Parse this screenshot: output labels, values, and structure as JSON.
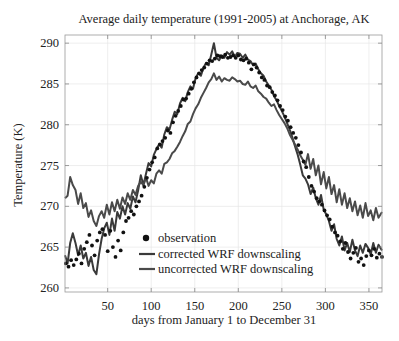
{
  "chart_data": {
    "type": "line",
    "title": "Average daily temperature (1991-2005) at Anchorage, AK",
    "xlabel": "days from January 1 to December 31",
    "ylabel": "Temperature (K)",
    "xlim": [
      1,
      365
    ],
    "ylim": [
      259.5,
      291
    ],
    "xticks": [
      50,
      100,
      150,
      200,
      250,
      300,
      350
    ],
    "yticks": [
      260,
      265,
      270,
      275,
      280,
      285,
      290
    ],
    "grid": true,
    "legend_position": "lower-left-center",
    "legend": [
      {
        "name": "observation",
        "marker": "dot",
        "color": "#111111"
      },
      {
        "name": "corrected WRF downscaling",
        "marker": "line",
        "color": "#3a3a3a"
      },
      {
        "name": "uncorrected WRF downscaling",
        "marker": "line",
        "color": "#4a4a4a"
      }
    ],
    "series": [
      {
        "name": "observation",
        "style": "scatter",
        "color": "#111111",
        "x": [
          2,
          5,
          8,
          11,
          14,
          17,
          20,
          23,
          26,
          29,
          32,
          35,
          38,
          41,
          44,
          47,
          50,
          53,
          56,
          59,
          62,
          65,
          68,
          71,
          74,
          77,
          80,
          83,
          86,
          89,
          92,
          95,
          98,
          101,
          104,
          107,
          110,
          113,
          116,
          119,
          122,
          125,
          128,
          131,
          134,
          137,
          140,
          143,
          146,
          149,
          152,
          155,
          158,
          161,
          164,
          167,
          170,
          173,
          176,
          179,
          182,
          185,
          188,
          191,
          194,
          197,
          200,
          203,
          206,
          209,
          212,
          215,
          218,
          221,
          224,
          227,
          230,
          233,
          236,
          239,
          242,
          245,
          248,
          251,
          254,
          257,
          260,
          263,
          266,
          269,
          272,
          275,
          278,
          281,
          284,
          287,
          290,
          293,
          296,
          299,
          302,
          305,
          308,
          311,
          314,
          317,
          320,
          323,
          326,
          329,
          332,
          335,
          338,
          341,
          344,
          347,
          350,
          353,
          356,
          359,
          362,
          365
        ],
        "y": [
          263.0,
          262.6,
          263.4,
          262.8,
          263.5,
          264.2,
          263.0,
          264.8,
          265.6,
          266.5,
          265.2,
          264.0,
          265.8,
          266.8,
          267.2,
          266.5,
          264.5,
          267.0,
          265.0,
          263.8,
          265.8,
          264.6,
          266.8,
          268.2,
          268.6,
          269.4,
          269.0,
          270.0,
          270.6,
          271.3,
          272.4,
          273.5,
          274.5,
          275.4,
          276.0,
          277.1,
          277.6,
          278.0,
          278.4,
          279.3,
          279.0,
          280.3,
          281.1,
          281.7,
          282.3,
          283.1,
          283.2,
          283.8,
          284.4,
          285.2,
          285.8,
          286.3,
          286.7,
          287.0,
          287.5,
          287.9,
          287.8,
          288.1,
          288.5,
          288.4,
          288.3,
          288.6,
          288.2,
          288.3,
          288.5,
          288.2,
          288.5,
          288.0,
          287.9,
          288.1,
          287.6,
          286.8,
          287.4,
          287.0,
          286.4,
          285.8,
          285.5,
          284.8,
          284.6,
          284.0,
          283.6,
          283.0,
          282.3,
          281.8,
          281.0,
          280.5,
          279.7,
          279.0,
          278.4,
          277.5,
          276.6,
          275.5,
          274.8,
          273.6,
          272.5,
          271.8,
          271.0,
          270.6,
          270.2,
          269.5,
          268.9,
          268.4,
          267.5,
          266.8,
          266.4,
          265.7,
          264.8,
          265.5,
          264.4,
          263.6,
          264.3,
          264.9,
          263.2,
          263.6,
          262.8,
          263.9,
          264.6,
          264.0,
          264.8,
          263.7,
          264.2,
          263.8
        ]
      },
      {
        "name": "corrected WRF downscaling",
        "style": "line",
        "color": "#3a3a3a",
        "x": [
          1,
          4,
          7,
          10,
          13,
          16,
          19,
          22,
          25,
          28,
          31,
          34,
          37,
          40,
          43,
          46,
          49,
          52,
          55,
          58,
          61,
          64,
          67,
          70,
          73,
          76,
          79,
          82,
          85,
          88,
          91,
          94,
          97,
          100,
          103,
          106,
          109,
          112,
          115,
          118,
          121,
          124,
          127,
          130,
          133,
          136,
          139,
          142,
          145,
          148,
          151,
          154,
          157,
          160,
          163,
          166,
          169,
          172,
          175,
          178,
          181,
          184,
          187,
          190,
          193,
          196,
          199,
          202,
          205,
          208,
          211,
          214,
          217,
          220,
          223,
          226,
          229,
          232,
          235,
          238,
          241,
          244,
          247,
          250,
          253,
          256,
          259,
          262,
          265,
          268,
          271,
          274,
          277,
          280,
          283,
          286,
          289,
          292,
          295,
          298,
          301,
          304,
          307,
          310,
          313,
          316,
          319,
          322,
          325,
          328,
          331,
          334,
          337,
          340,
          343,
          346,
          349,
          352,
          355,
          358,
          361,
          365
        ],
        "y": [
          264.0,
          263.0,
          265.5,
          266.7,
          265.5,
          264.0,
          265.2,
          263.6,
          264.3,
          262.7,
          263.8,
          262.2,
          261.7,
          264.1,
          266.0,
          267.3,
          268.0,
          266.5,
          268.5,
          267.0,
          269.3,
          268.5,
          270.0,
          269.0,
          270.4,
          269.7,
          271.2,
          270.5,
          272.0,
          273.8,
          272.6,
          274.0,
          275.3,
          274.9,
          276.3,
          277.0,
          277.6,
          277.2,
          278.8,
          279.7,
          279.4,
          280.6,
          281.6,
          281.3,
          282.6,
          283.3,
          282.9,
          284.0,
          284.7,
          284.4,
          285.7,
          286.3,
          286.0,
          287.0,
          287.6,
          287.3,
          288.6,
          290.0,
          288.2,
          287.9,
          288.5,
          288.2,
          288.9,
          288.6,
          289.0,
          288.3,
          288.8,
          288.7,
          288.2,
          288.6,
          288.0,
          287.8,
          287.3,
          287.5,
          286.8,
          286.3,
          286.0,
          285.3,
          284.8,
          284.3,
          283.5,
          283.0,
          282.3,
          281.7,
          281.0,
          280.2,
          279.4,
          278.5,
          277.4,
          276.4,
          275.2,
          273.8,
          273.4,
          272.7,
          271.5,
          272.3,
          271.0,
          270.2,
          271.4,
          269.6,
          269.0,
          268.2,
          267.0,
          267.8,
          266.0,
          265.2,
          266.3,
          264.6,
          265.5,
          264.4,
          265.9,
          264.6,
          263.9,
          265.2,
          264.3,
          265.4,
          264.9,
          264.1,
          265.5,
          264.3,
          265.3,
          264.6
        ]
      },
      {
        "name": "uncorrected WRF downscaling",
        "style": "line",
        "color": "#4a4a4a",
        "x": [
          1,
          4,
          7,
          10,
          13,
          16,
          19,
          22,
          25,
          28,
          31,
          34,
          37,
          40,
          43,
          46,
          49,
          52,
          55,
          58,
          61,
          64,
          67,
          70,
          73,
          76,
          79,
          82,
          85,
          88,
          91,
          94,
          97,
          100,
          103,
          106,
          109,
          112,
          115,
          118,
          121,
          124,
          127,
          130,
          133,
          136,
          139,
          142,
          145,
          148,
          151,
          154,
          157,
          160,
          163,
          166,
          169,
          172,
          175,
          178,
          181,
          184,
          187,
          190,
          193,
          196,
          199,
          202,
          205,
          208,
          211,
          214,
          217,
          220,
          223,
          226,
          229,
          232,
          235,
          238,
          241,
          244,
          247,
          250,
          253,
          256,
          259,
          262,
          265,
          268,
          271,
          274,
          277,
          280,
          283,
          286,
          289,
          292,
          295,
          298,
          301,
          304,
          307,
          310,
          313,
          316,
          319,
          322,
          325,
          328,
          331,
          334,
          337,
          340,
          343,
          346,
          349,
          352,
          355,
          358,
          361,
          365
        ],
        "y": [
          271.0,
          271.3,
          273.6,
          272.6,
          272.0,
          270.3,
          271.6,
          269.8,
          270.4,
          268.7,
          269.5,
          268.2,
          267.6,
          268.8,
          269.4,
          268.6,
          270.2,
          269.0,
          270.5,
          269.4,
          270.8,
          269.7,
          271.1,
          270.3,
          271.6,
          270.8,
          272.0,
          271.4,
          272.5,
          273.0,
          272.6,
          273.5,
          272.5,
          273.2,
          272.8,
          274.0,
          274.4,
          274.0,
          275.2,
          275.4,
          275.8,
          276.5,
          276.8,
          277.3,
          277.9,
          278.6,
          279.2,
          280.1,
          280.4,
          281.3,
          282.0,
          282.5,
          283.3,
          283.9,
          284.5,
          285.2,
          285.6,
          286.3,
          285.5,
          285.9,
          285.3,
          285.7,
          285.5,
          285.4,
          285.8,
          285.6,
          285.3,
          285.4,
          285.0,
          284.9,
          285.3,
          284.7,
          284.5,
          284.8,
          284.1,
          283.8,
          283.4,
          283.2,
          282.7,
          282.3,
          282.5,
          281.8,
          281.2,
          280.7,
          280.2,
          279.6,
          278.8,
          278.2,
          277.6,
          277.0,
          276.3,
          275.7,
          275.1,
          276.4,
          274.6,
          275.8,
          273.8,
          275.0,
          272.7,
          274.2,
          272.2,
          273.6,
          271.5,
          272.6,
          270.5,
          272.1,
          270.2,
          271.6,
          269.8,
          271.0,
          269.4,
          270.6,
          268.9,
          270.1,
          268.6,
          270.4,
          268.8,
          269.5,
          268.3,
          269.8,
          268.6,
          269.3
        ]
      }
    ]
  }
}
